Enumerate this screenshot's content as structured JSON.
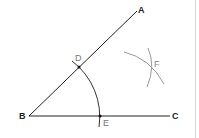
{
  "diagram": {
    "points": {
      "A": {
        "label": "A",
        "x": 137,
        "y": 11
      },
      "B": {
        "label": "B",
        "x": 29,
        "y": 116
      },
      "C": {
        "label": "C",
        "x": 170,
        "y": 116
      },
      "D": {
        "label": "D",
        "x": 79,
        "y": 67
      },
      "E": {
        "label": "E",
        "x": 100,
        "y": 116
      },
      "F": {
        "label": "F",
        "x": 151,
        "y": 68
      }
    },
    "colors": {
      "line": "#222222",
      "arc": "#333333",
      "light_arc": "#888888",
      "label": "#222222",
      "light_label": "#777777",
      "border": "#d8d8d8"
    }
  }
}
